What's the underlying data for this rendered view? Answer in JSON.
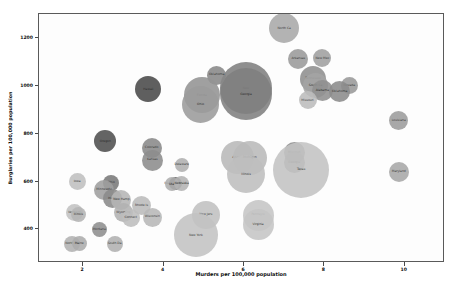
{
  "chart_data": {
    "type": "scatter",
    "title": "",
    "xlabel": "Murders per 100,000 population",
    "ylabel": "Burglaries per 100,000 population",
    "xlim": [
      0.9,
      11.0
    ],
    "ylim": [
      260,
      1300
    ],
    "xticks": [
      2,
      4,
      6,
      8,
      10
    ],
    "xticklabels": [
      "2",
      "4",
      "6",
      "8",
      "10"
    ],
    "yticks": [
      400,
      600,
      800,
      1000,
      1200
    ],
    "yticklabels": [
      "400",
      "600",
      "800",
      "1000",
      "1200"
    ],
    "grid": false,
    "legend": null,
    "size_encoding": "population",
    "points": [
      {
        "label": "North Ca",
        "x": 7.0,
        "y": 1240,
        "r": 15.0,
        "shade": "#a9a9a9"
      },
      {
        "label": "Arkansas",
        "x": 7.35,
        "y": 1112,
        "r": 10.0,
        "shade": "#9b9b9b"
      },
      {
        "label": "New Mex",
        "x": 7.95,
        "y": 1115,
        "r": 9.0,
        "shade": "#a0a0a0"
      },
      {
        "label": "Tennessee",
        "x": 7.72,
        "y": 1028,
        "r": 13.0,
        "shade": "#8f8f8f"
      },
      {
        "label": "South Ca",
        "x": 7.78,
        "y": 1000,
        "r": 12.5,
        "shade": "#a5a5a5"
      },
      {
        "label": "Alabama",
        "x": 7.95,
        "y": 980,
        "r": 10.5,
        "shade": "#909090"
      },
      {
        "label": "Missouri",
        "x": 7.58,
        "y": 940,
        "r": 9.0,
        "shade": "#bdbdbd"
      },
      {
        "label": "Nevada",
        "x": 8.62,
        "y": 1000,
        "r": 8.5,
        "shade": "#9a9a9a"
      },
      {
        "label": "Oklahoma",
        "x": 8.38,
        "y": 975,
        "r": 10.5,
        "shade": "#8c8c8c"
      },
      {
        "label": "New",
        "x": 6.05,
        "y": 990,
        "r": 26.0,
        "shade": "#808080"
      },
      {
        "label": "Georgia",
        "x": 6.05,
        "y": 965,
        "r": 26.0,
        "shade": "#808080"
      },
      {
        "label": "Oklahoma",
        "x": 5.32,
        "y": 1045,
        "r": 9.5,
        "shade": "#888888"
      },
      {
        "label": "Florida",
        "x": 4.95,
        "y": 960,
        "r": 18.0,
        "shade": "#949494"
      },
      {
        "label": "Ohio",
        "x": 4.92,
        "y": 920,
        "r": 18.5,
        "shade": "#9c9c9c"
      },
      {
        "label": "Hawaii",
        "x": 3.62,
        "y": 985,
        "r": 13.0,
        "shade": "#4a4a4a"
      },
      {
        "label": "Louisiana",
        "x": 9.85,
        "y": 855,
        "r": 9.5,
        "shade": "#9d9d9d"
      },
      {
        "label": "Maryland",
        "x": 9.85,
        "y": 640,
        "r": 10.0,
        "shade": "#a8a8a8"
      },
      {
        "label": "Oregon",
        "x": 2.55,
        "y": 768,
        "r": 11.0,
        "shade": "#4f4f4f"
      },
      {
        "label": "Colorado",
        "x": 3.7,
        "y": 740,
        "r": 10.0,
        "shade": "#8a8a8a"
      },
      {
        "label": "Kansas",
        "x": 3.72,
        "y": 690,
        "r": 10.5,
        "shade": "#8d8d8d"
      },
      {
        "label": "Delaware",
        "x": 4.45,
        "y": 670,
        "r": 7.0,
        "shade": "#b0b0b0"
      },
      {
        "label": "Washington DC",
        "x": 4.3,
        "y": 590,
        "r": 6.5,
        "shade": "#6a6a6a"
      },
      {
        "label": "Utah",
        "x": 4.22,
        "y": 588,
        "r": 7.0,
        "shade": "#aeaeae"
      },
      {
        "label": "Nebraska",
        "x": 4.45,
        "y": 590,
        "r": 7.5,
        "shade": "#b4b4b4"
      },
      {
        "label": "Arizona",
        "x": 5.85,
        "y": 700,
        "r": 16.5,
        "shade": "#b9b9b9"
      },
      {
        "label": "Michigan",
        "x": 6.15,
        "y": 700,
        "r": 17.0,
        "shade": "#bbbbbb"
      },
      {
        "label": "Illinois",
        "x": 6.05,
        "y": 630,
        "r": 19.0,
        "shade": "#bfbfbf"
      },
      {
        "label": "Missouri",
        "x": 7.25,
        "y": 720,
        "r": 10.5,
        "shade": "#8e8e8e"
      },
      {
        "label": "Georgia",
        "x": 7.25,
        "y": 680,
        "r": 10.5,
        "shade": "#8e8e8e"
      },
      {
        "label": "Texas",
        "x": 7.42,
        "y": 650,
        "r": 28.0,
        "shade": "#c4c4c4"
      },
      {
        "label": "Iowa",
        "x": 1.85,
        "y": 600,
        "r": 8.5,
        "shade": "#c0c0c0"
      },
      {
        "label": "Ohio",
        "x": 2.7,
        "y": 595,
        "r": 8.0,
        "shade": "#7a7a7a"
      },
      {
        "label": "Minnesota",
        "x": 2.52,
        "y": 565,
        "r": 10.0,
        "shade": "#9f9f9f"
      },
      {
        "label": "Idaho",
        "x": 2.72,
        "y": 530,
        "r": 9.5,
        "shade": "#8b8b8b"
      },
      {
        "label": "New Hamp",
        "x": 2.95,
        "y": 525,
        "r": 10.0,
        "shade": "#b6b6b6"
      },
      {
        "label": "Rhode Is",
        "x": 3.45,
        "y": 500,
        "r": 9.5,
        "shade": "#bcbcbc"
      },
      {
        "label": "Wyoming",
        "x": 3.0,
        "y": 470,
        "r": 9.5,
        "shade": "#b2b2b2"
      },
      {
        "label": "Connect",
        "x": 3.18,
        "y": 450,
        "r": 9.0,
        "shade": "#bebebe"
      },
      {
        "label": "Wisconsin",
        "x": 3.72,
        "y": 452,
        "r": 9.5,
        "shade": "#b8b8b8"
      },
      {
        "label": "Vermont",
        "x": 1.78,
        "y": 470,
        "r": 8.5,
        "shade": "#c2c2c2"
      },
      {
        "label": "Illinois",
        "x": 1.88,
        "y": 462,
        "r": 7.5,
        "shade": "#b5b5b5"
      },
      {
        "label": "Montana",
        "x": 2.4,
        "y": 400,
        "r": 7.5,
        "shade": "#8f8f8f"
      },
      {
        "label": "South Da",
        "x": 2.78,
        "y": 340,
        "r": 8.0,
        "shade": "#b1b1b1"
      },
      {
        "label": "North Da",
        "x": 1.72,
        "y": 340,
        "r": 8.0,
        "shade": "#b3b3b3"
      },
      {
        "label": "Maine",
        "x": 1.9,
        "y": 342,
        "r": 7.5,
        "shade": "#adadad"
      },
      {
        "label": "New Jers",
        "x": 5.05,
        "y": 460,
        "r": 14.0,
        "shade": "#c1c1c1"
      },
      {
        "label": "New York",
        "x": 4.8,
        "y": 375,
        "r": 22.0,
        "shade": "#c3c3c3"
      },
      {
        "label": "Pennsylv",
        "x": 6.35,
        "y": 460,
        "r": 15.5,
        "shade": "#c6c6c6"
      },
      {
        "label": "Virginia",
        "x": 6.35,
        "y": 420,
        "r": 15.5,
        "shade": "#c6c6c6"
      }
    ]
  },
  "axes": {
    "xlabel": "Murders per 100,000 population",
    "ylabel": "Burglaries per 100,000 population"
  }
}
